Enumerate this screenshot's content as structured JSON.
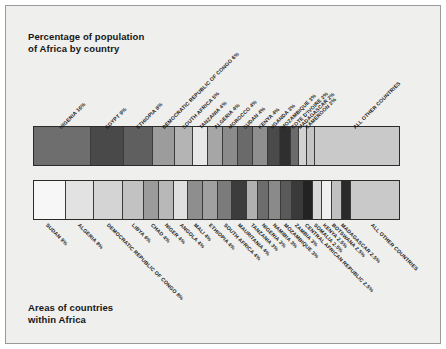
{
  "figure": {
    "background": "#efefed",
    "frame_color": "#9a9a98",
    "top_title": "Percentage of population\nof Africa by country",
    "bottom_title": "Areas of countries\nwithin Africa"
  },
  "chart_data": [
    {
      "type": "bar",
      "orientation": "stacked-horizontal",
      "title": "Percentage of population of Africa by country",
      "xlabel": "",
      "ylabel": "",
      "categories": [
        "NIGERIA",
        "EGYPT",
        "ETHIOPIA",
        "DEMOCRATIC REPUBLIC OF CONGO",
        "SOUTH AFRICA",
        "TANZANIA",
        "ALGERIA",
        "MOROCCO",
        "SUDAN",
        "KENYA",
        "UGANDA",
        "MOZAMBIQUE",
        "COTE D'IVOIRE",
        "MADAGASCAR",
        "CAMEROON",
        "ALL OTHER COUNTRIES"
      ],
      "values": [
        16,
        9,
        8,
        6,
        5,
        4,
        4,
        4,
        4,
        4,
        3,
        3,
        2,
        2,
        2,
        24
      ],
      "labels": [
        "NIGERIA 16%",
        "EGYPT 9%",
        "ETHIOPIA 8%",
        "DEMOCRATIC REPUBLIC OF CONGO 6%",
        "SOUTH AFRICA 5%",
        "TANZANIA 4%",
        "ALGERIA 4%",
        "MOROCCO 4%",
        "SUDAN 4%",
        "KENYA 4%",
        "UGANDA 3%",
        "MOZAMBIQUE 3%",
        "COTE D'IVOIRE 2%",
        "MADAGASCAR 2%",
        "CAMEROON 2%",
        "ALL OTHER COUNTRIES"
      ],
      "colors": [
        "#6e6e6e",
        "#494949",
        "#5f5f5f",
        "#9c9c9c",
        "#b4b4b4",
        "#e8e8e8",
        "#a6a6a6",
        "#8b8b8b",
        "#6a6a6a",
        "#8f8f8f",
        "#4a4a4a",
        "#2f2f2f",
        "#6b6b6b",
        "#d2d2d2",
        "#c4c4c4",
        "#c9c9c9"
      ],
      "grid": false,
      "legend": "none"
    },
    {
      "type": "bar",
      "orientation": "stacked-horizontal",
      "title": "Areas of countries within Africa",
      "xlabel": "",
      "ylabel": "",
      "categories": [
        "SUDAN",
        "ALGERIA",
        "DEMOCRATIC REPUBLIC OF CONGO",
        "LIBYA",
        "CHAD",
        "NIGER",
        "ANGOLA",
        "MALI",
        "ETHIOPIA",
        "SOUTH AFRICA",
        "MAURITANIA",
        "TANZANIA",
        "NIGERIA",
        "NAMIBIA",
        "MOZAMBIQUE",
        "ZAMBIA",
        "CENTRAL AFRICAN REPUBLIC",
        "SOMALIA",
        "KENYA",
        "BOTSWANA",
        "MADAGASCAR",
        "ALL OTHER COUNTRIES"
      ],
      "values": [
        9,
        8,
        8,
        6,
        4,
        4,
        4,
        4,
        4,
        4,
        4,
        3,
        3,
        3,
        3,
        3,
        2.5,
        2.5,
        2.5,
        2.5,
        2.5,
        14
      ],
      "labels": [
        "SUDAN 9%",
        "ALGERIA 8%",
        "DEMOCRATIC REPUBLIC OF CONGO 8%",
        "LIBYA 6%",
        "CHAD 4%",
        "NIGER 4%",
        "ANGOLA 4%",
        "MALI 4%",
        "ETHIOPIA 4%",
        "SOUTH AFRICA 4%",
        "MAURITANIA 4%",
        "TANZANIA 3%",
        "NIGERIA 3%",
        "NAMIBIA 3%",
        "MOZAMBIQUE 3%",
        "ZAMBIA 3%",
        "CENTRAL AFRICAN REPUBLIC 2.5%",
        "SOMALIA 2.5%",
        "KENYA 2.5%",
        "BOTSWANA 2.5%",
        "MADAGASCAR 2.5%",
        "ALL OTHER COUNTRIES"
      ],
      "colors": [
        "#f7f7f7",
        "#e2e2e2",
        "#d4d4d4",
        "#c2c2c2",
        "#9b9b9b",
        "#b8b8b8",
        "#e0e0e0",
        "#8e8e8e",
        "#a0a0a0",
        "#7b7b7b",
        "#3c3c3c",
        "#b0b0b0",
        "#6d6d6d",
        "#8a8a8a",
        "#5a5a5a",
        "#3a3a3a",
        "#232323",
        "#d8d8d8",
        "#f0f0f0",
        "#c0c0c0",
        "#2a2a2a",
        "#c9c9c9"
      ],
      "grid": false,
      "legend": "none"
    }
  ]
}
